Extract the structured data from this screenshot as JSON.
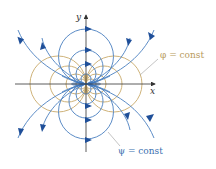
{
  "diagram": {
    "axes": {
      "x_label": "x",
      "y_label": "y"
    },
    "labels": {
      "phi": "φ = const",
      "psi": "ψ = const"
    },
    "colors": {
      "streamline": "#3a6fb0",
      "streamline_arrow": "#1f4f99",
      "equipotential": "#c8a96a",
      "axis": "#333333",
      "phi_label": "#b89a5c",
      "psi_label": "#3a6fb0",
      "leader_line": "#aaaaaa"
    },
    "origin": [
      86,
      84
    ],
    "streamline_radii": [
      10,
      17,
      27.5
    ],
    "equipotential_radii": [
      10,
      18,
      28
    ]
  }
}
